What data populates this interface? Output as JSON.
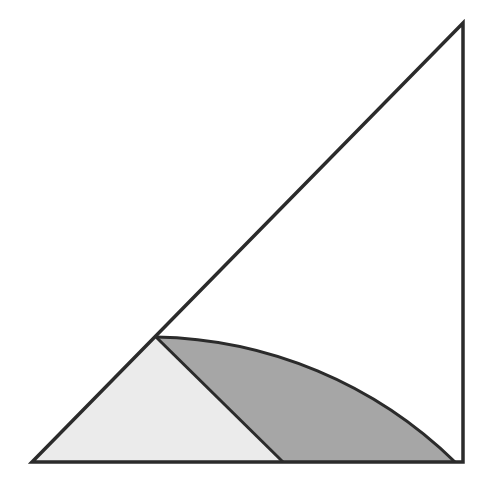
{
  "figure": {
    "type": "geometry-diagram",
    "colors": {
      "background": "#ffffff",
      "stroke": "#2b2b2b",
      "light_fill": "#ebebeb",
      "dark_fill": "#a6a6a6",
      "outer_fill": "#ffffff"
    },
    "points": {
      "A_bottom_left": [
        32,
        462
      ],
      "B_bottom_right": [
        463,
        462
      ],
      "C_top_right": [
        463,
        23
      ],
      "D_on_hypotenuse": [
        156,
        337
      ],
      "E_on_base": [
        283,
        462
      ],
      "F_arc_end": [
        455,
        462
      ]
    },
    "arc": {
      "center": [
        463,
        23
      ],
      "radius": 439
    },
    "regions": [
      {
        "name": "light-triangle",
        "vertices": [
          "A_bottom_left",
          "D_on_hypotenuse",
          "E_on_base"
        ],
        "fill": "#ebebeb"
      },
      {
        "name": "dark-curved-region",
        "bounded_by": [
          "segment D-E",
          "base E-F",
          "arc F-D"
        ],
        "fill": "#a6a6a6"
      }
    ]
  }
}
